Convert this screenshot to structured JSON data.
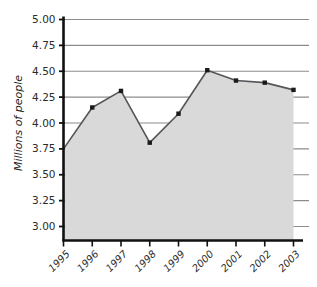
{
  "chart_data": {
    "type": "area",
    "title": "",
    "subtitle": "",
    "xlabel": "",
    "ylabel": "Millions of people",
    "categories": [
      "1995",
      "1996",
      "1997",
      "1998",
      "1999",
      "2000",
      "2001",
      "2002",
      "2003"
    ],
    "values": [
      3.75,
      4.15,
      4.31,
      3.81,
      4.09,
      4.51,
      4.41,
      4.39,
      4.32
    ],
    "series": [
      {
        "name": "Millions of people",
        "values": [
          3.75,
          4.15,
          4.31,
          3.81,
          4.09,
          4.51,
          4.41,
          4.39,
          4.32
        ]
      }
    ],
    "ylim": [
      3.0,
      5.0
    ],
    "ytick_step": 0.25,
    "ytick_labels": [
      "3.00",
      "3.25",
      "3.50",
      "3.75",
      "4.00",
      "4.25",
      "4.50",
      "4.75",
      "5.00"
    ],
    "ytick_values": [
      3.0,
      3.25,
      3.5,
      3.75,
      4.0,
      4.25,
      4.5,
      4.75,
      5.0
    ],
    "grid": true,
    "grid_axis": "y",
    "legend": false,
    "legend_position": "none",
    "marker": "square",
    "colors": {
      "area_fill": "#d9d9d9",
      "line": "#55555a",
      "marker": "#1a1a1a",
      "gridline": "#8c8c8c",
      "axis": "#111111",
      "text": "#2b2b2b",
      "background": "#ffffff"
    }
  },
  "axes": {
    "y_title": "Millions of people"
  }
}
